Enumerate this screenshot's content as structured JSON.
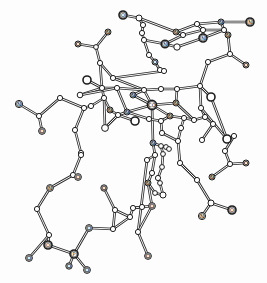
{
  "diagram": {
    "title": "",
    "type": "ball-and-stick molecular structure",
    "colors": {
      "line": "#2a2a2a",
      "atom_fill": "#ffffff",
      "background": "#fdfdfd"
    },
    "atoms": [
      {
        "id": "a1",
        "x": 123,
        "y": 15,
        "r": 4,
        "label": "O"
      },
      {
        "id": "a2",
        "x": 139,
        "y": 18,
        "r": 3,
        "label": ""
      },
      {
        "id": "a3",
        "x": 143,
        "y": 25,
        "r": 2.6,
        "label": ""
      },
      {
        "id": "a4",
        "x": 142,
        "y": 33,
        "r": 2.6,
        "label": ""
      },
      {
        "id": "a5",
        "x": 144,
        "y": 40,
        "r": 2.6,
        "label": ""
      },
      {
        "id": "a6",
        "x": 149,
        "y": 55,
        "r": 2.6,
        "label": ""
      },
      {
        "id": "a7",
        "x": 155,
        "y": 62,
        "r": 3,
        "label": "O"
      },
      {
        "id": "a8",
        "x": 160,
        "y": 70,
        "r": 2.6,
        "label": ""
      },
      {
        "id": "a9",
        "x": 164,
        "y": 71,
        "r": 2.6,
        "label": ""
      },
      {
        "id": "b1",
        "x": 197,
        "y": 24,
        "r": 2.6,
        "label": ""
      },
      {
        "id": "b2",
        "x": 221,
        "y": 22,
        "r": 3,
        "label": "N"
      },
      {
        "id": "b3",
        "x": 250,
        "y": 22,
        "r": 4,
        "label": "N"
      },
      {
        "id": "b4",
        "x": 176,
        "y": 32,
        "r": 3,
        "label": "N"
      },
      {
        "id": "b5",
        "x": 183,
        "y": 35,
        "r": 2.6,
        "label": ""
      },
      {
        "id": "b6",
        "x": 203,
        "y": 30,
        "r": 2.6,
        "label": ""
      },
      {
        "id": "b7",
        "x": 224,
        "y": 30,
        "r": 2.6,
        "label": ""
      },
      {
        "id": "b8",
        "x": 228,
        "y": 35,
        "r": 3,
        "label": "N"
      },
      {
        "id": "b9",
        "x": 203,
        "y": 38,
        "r": 4,
        "label": "N"
      },
      {
        "id": "b10",
        "x": 165,
        "y": 44,
        "r": 3.8,
        "label": "N"
      },
      {
        "id": "b11",
        "x": 177,
        "y": 47,
        "r": 3.2,
        "label": ""
      },
      {
        "id": "b12",
        "x": 230,
        "y": 54,
        "r": 2.6,
        "label": ""
      },
      {
        "id": "b13",
        "x": 208,
        "y": 62,
        "r": 2.6,
        "label": ""
      },
      {
        "id": "b14",
        "x": 246,
        "y": 65,
        "r": 3,
        "label": "O"
      },
      {
        "id": "c1",
        "x": 108,
        "y": 32,
        "r": 3,
        "label": "N"
      },
      {
        "id": "c2",
        "x": 78,
        "y": 44,
        "r": 3,
        "label": "O"
      },
      {
        "id": "c3",
        "x": 96,
        "y": 47,
        "r": 2.4,
        "label": ""
      },
      {
        "id": "c4",
        "x": 100,
        "y": 63,
        "r": 2.6,
        "label": ""
      },
      {
        "id": "c5",
        "x": 113,
        "y": 78,
        "r": 2.6,
        "label": ""
      },
      {
        "id": "c6",
        "x": 87,
        "y": 80,
        "r": 4,
        "label": ""
      },
      {
        "id": "c7",
        "x": 80,
        "y": 95,
        "r": 2.8,
        "label": ""
      },
      {
        "id": "c8",
        "x": 102,
        "y": 88,
        "r": 2.6,
        "label": ""
      },
      {
        "id": "c9",
        "x": 117,
        "y": 88,
        "r": 2.6,
        "label": ""
      },
      {
        "id": "c10",
        "x": 104,
        "y": 98,
        "r": 2.6,
        "label": ""
      },
      {
        "id": "c11",
        "x": 91,
        "y": 106,
        "r": 2.6,
        "label": ""
      },
      {
        "id": "c12",
        "x": 84,
        "y": 108,
        "r": 2.6,
        "label": ""
      },
      {
        "id": "c13",
        "x": 110,
        "y": 110,
        "r": 3,
        "label": "N"
      },
      {
        "id": "c14",
        "x": 127,
        "y": 112,
        "r": 3,
        "label": "N"
      },
      {
        "id": "c15",
        "x": 118,
        "y": 115,
        "r": 2.6,
        "label": ""
      },
      {
        "id": "c16",
        "x": 105,
        "y": 128,
        "r": 3.4,
        "label": ""
      },
      {
        "id": "c17",
        "x": 135,
        "y": 121,
        "r": 4,
        "label": ""
      },
      {
        "id": "c18",
        "x": 75,
        "y": 130,
        "r": 2.6,
        "label": ""
      },
      {
        "id": "c19",
        "x": 60,
        "y": 98,
        "r": 2.6,
        "label": ""
      },
      {
        "id": "c20",
        "x": 39,
        "y": 116,
        "r": 2.6,
        "label": ""
      },
      {
        "id": "c21",
        "x": 19,
        "y": 104,
        "r": 3.6,
        "label": "N"
      },
      {
        "id": "c22",
        "x": 42,
        "y": 131,
        "r": 3.4,
        "label": "O"
      },
      {
        "id": "c23",
        "x": 81,
        "y": 153,
        "r": 2.6,
        "label": ""
      },
      {
        "id": "co",
        "x": 152,
        "y": 105,
        "r": 4.6,
        "label": "CO"
      },
      {
        "id": "d1",
        "x": 144,
        "y": 90,
        "r": 2.6,
        "label": ""
      },
      {
        "id": "d2",
        "x": 177,
        "y": 89,
        "r": 2.6,
        "label": ""
      },
      {
        "id": "d3",
        "x": 161,
        "y": 89,
        "r": 2.6,
        "label": ""
      },
      {
        "id": "d4",
        "x": 133,
        "y": 95,
        "r": 3,
        "label": "N"
      },
      {
        "id": "d5",
        "x": 176,
        "y": 103,
        "r": 3,
        "label": "N"
      },
      {
        "id": "d6",
        "x": 170,
        "y": 116,
        "r": 3,
        "label": "N"
      },
      {
        "id": "d7",
        "x": 161,
        "y": 121,
        "r": 2.6,
        "label": ""
      },
      {
        "id": "d8",
        "x": 149,
        "y": 119,
        "r": 2.6,
        "label": ""
      },
      {
        "id": "d9",
        "x": 200,
        "y": 86,
        "r": 2.6,
        "label": ""
      },
      {
        "id": "d10",
        "x": 211,
        "y": 97,
        "r": 4,
        "label": ""
      },
      {
        "id": "d11",
        "x": 201,
        "y": 108,
        "r": 2.6,
        "label": ""
      },
      {
        "id": "d12",
        "x": 205,
        "y": 117,
        "r": 2.6,
        "label": ""
      },
      {
        "id": "d13",
        "x": 194,
        "y": 120,
        "r": 2.6,
        "label": ""
      },
      {
        "id": "d14",
        "x": 184,
        "y": 118,
        "r": 2.6,
        "label": ""
      },
      {
        "id": "d15",
        "x": 181,
        "y": 128,
        "r": 2.6,
        "label": ""
      },
      {
        "id": "d16",
        "x": 162,
        "y": 133,
        "r": 2.6,
        "label": ""
      },
      {
        "id": "d17",
        "x": 178,
        "y": 141,
        "r": 2.6,
        "label": ""
      },
      {
        "id": "d18",
        "x": 202,
        "y": 140,
        "r": 2.6,
        "label": ""
      },
      {
        "id": "d19",
        "x": 213,
        "y": 124,
        "r": 2.6,
        "label": ""
      },
      {
        "id": "e1",
        "x": 234,
        "y": 136,
        "r": 2.6,
        "label": ""
      },
      {
        "id": "e2",
        "x": 227,
        "y": 139,
        "r": 4,
        "label": ""
      },
      {
        "id": "e3",
        "x": 225,
        "y": 151,
        "r": 2.6,
        "label": ""
      },
      {
        "id": "e4",
        "x": 230,
        "y": 164,
        "r": 2.6,
        "label": ""
      },
      {
        "id": "e5",
        "x": 246,
        "y": 163,
        "r": 3,
        "label": "O"
      },
      {
        "id": "e6",
        "x": 212,
        "y": 177,
        "r": 3,
        "label": "N"
      },
      {
        "id": "f1",
        "x": 153,
        "y": 143,
        "r": 3,
        "label": "N"
      },
      {
        "id": "f2",
        "x": 161,
        "y": 146,
        "r": 2.4,
        "label": ""
      },
      {
        "id": "f3",
        "x": 166,
        "y": 147,
        "r": 2.4,
        "label": ""
      },
      {
        "id": "f4",
        "x": 169,
        "y": 149,
        "r": 2.4,
        "label": ""
      },
      {
        "id": "f5",
        "x": 155,
        "y": 155,
        "r": 2.6,
        "label": ""
      },
      {
        "id": "f6",
        "x": 163,
        "y": 154,
        "r": 2.4,
        "label": ""
      },
      {
        "id": "f7",
        "x": 147,
        "y": 160,
        "r": 2.6,
        "label": ""
      },
      {
        "id": "f8",
        "x": 162,
        "y": 167,
        "r": 2.4,
        "label": ""
      },
      {
        "id": "f9",
        "x": 152,
        "y": 173,
        "r": 2.6,
        "label": ""
      },
      {
        "id": "f10",
        "x": 158,
        "y": 178,
        "r": 2.6,
        "label": ""
      },
      {
        "id": "f11",
        "x": 148,
        "y": 183,
        "r": 3,
        "label": "N"
      },
      {
        "id": "f12",
        "x": 160,
        "y": 183,
        "r": 2.4,
        "label": ""
      },
      {
        "id": "f13",
        "x": 155,
        "y": 193,
        "r": 2.4,
        "label": ""
      },
      {
        "id": "f14",
        "x": 163,
        "y": 195,
        "r": 3,
        "label": ""
      },
      {
        "id": "g1",
        "x": 180,
        "y": 163,
        "r": 2.6,
        "label": ""
      },
      {
        "id": "g2",
        "x": 197,
        "y": 180,
        "r": 2.6,
        "label": ""
      },
      {
        "id": "g3",
        "x": 211,
        "y": 203,
        "r": 3,
        "label": ""
      },
      {
        "id": "g4",
        "x": 232,
        "y": 210,
        "r": 4,
        "label": "O"
      },
      {
        "id": "g5",
        "x": 202,
        "y": 216,
        "r": 3.6,
        "label": "N"
      },
      {
        "id": "h1",
        "x": 142,
        "y": 207,
        "r": 2.6,
        "label": ""
      },
      {
        "id": "h2",
        "x": 152,
        "y": 206,
        "r": 3.4,
        "label": "O"
      },
      {
        "id": "h3",
        "x": 138,
        "y": 232,
        "r": 2.6,
        "label": ""
      },
      {
        "id": "h4",
        "x": 148,
        "y": 256,
        "r": 3.4,
        "label": "O"
      },
      {
        "id": "i1",
        "x": 81,
        "y": 155,
        "r": 2.6,
        "label": ""
      },
      {
        "id": "i2",
        "x": 73,
        "y": 175,
        "r": 2.6,
        "label": ""
      },
      {
        "id": "i3",
        "x": 78,
        "y": 177,
        "r": 3.4,
        "label": "O"
      },
      {
        "id": "i4",
        "x": 50,
        "y": 188,
        "r": 3.4,
        "label": "N"
      },
      {
        "id": "i5",
        "x": 37,
        "y": 209,
        "r": 2.6,
        "label": ""
      },
      {
        "id": "i6",
        "x": 49,
        "y": 235,
        "r": 2.6,
        "label": ""
      },
      {
        "id": "i7",
        "x": 48,
        "y": 245,
        "r": 4,
        "label": "O"
      },
      {
        "id": "i8",
        "x": 29,
        "y": 258,
        "r": 3.4,
        "label": "O"
      },
      {
        "id": "i9",
        "x": 74,
        "y": 254,
        "r": 4,
        "label": "P"
      },
      {
        "id": "i10",
        "x": 69,
        "y": 266,
        "r": 3.2,
        "label": "O"
      },
      {
        "id": "i11",
        "x": 87,
        "y": 270,
        "r": 3.4,
        "label": "O"
      },
      {
        "id": "i12",
        "x": 89,
        "y": 228,
        "r": 3.4,
        "label": "O"
      },
      {
        "id": "j1",
        "x": 104,
        "y": 188,
        "r": 3.2,
        "label": "O"
      },
      {
        "id": "j2",
        "x": 115,
        "y": 210,
        "r": 2.6,
        "label": ""
      },
      {
        "id": "j3",
        "x": 113,
        "y": 229,
        "r": 2.6,
        "label": ""
      },
      {
        "id": "j4",
        "x": 130,
        "y": 217,
        "r": 2.6,
        "label": ""
      },
      {
        "id": "j5",
        "x": 133,
        "y": 208,
        "r": 2.6,
        "label": ""
      }
    ],
    "bonds": [
      [
        "a1",
        "a2"
      ],
      [
        "a2",
        "a3"
      ],
      [
        "a3",
        "a4"
      ],
      [
        "a4",
        "a5"
      ],
      [
        "a5",
        "a6"
      ],
      [
        "a6",
        "a7"
      ],
      [
        "a7",
        "a8"
      ],
      [
        "a8",
        "a9"
      ],
      [
        "a5",
        "b10"
      ],
      [
        "a2",
        "b4"
      ],
      [
        "b4",
        "b1"
      ],
      [
        "b1",
        "b2"
      ],
      [
        "b2",
        "b3"
      ],
      [
        "b4",
        "b5"
      ],
      [
        "b5",
        "b6"
      ],
      [
        "b6",
        "b7"
      ],
      [
        "b7",
        "b8"
      ],
      [
        "b2",
        "b7"
      ],
      [
        "b10",
        "b11"
      ],
      [
        "b11",
        "b9"
      ],
      [
        "b9",
        "b7"
      ],
      [
        "b10",
        "b5"
      ],
      [
        "b6",
        "b9"
      ],
      [
        "b1",
        "b6"
      ],
      [
        "b8",
        "b12"
      ],
      [
        "b12",
        "b13"
      ],
      [
        "b12",
        "b14"
      ],
      [
        "b13",
        "d9"
      ],
      [
        "c1",
        "c3"
      ],
      [
        "c2",
        "c3"
      ],
      [
        "c3",
        "c4"
      ],
      [
        "c4",
        "c5"
      ],
      [
        "c4",
        "c8"
      ],
      [
        "c5",
        "a9"
      ],
      [
        "c5",
        "d1"
      ],
      [
        "c6",
        "c8"
      ],
      [
        "c7",
        "c8"
      ],
      [
        "c8",
        "c9"
      ],
      [
        "c8",
        "c10"
      ],
      [
        "c9",
        "d1"
      ],
      [
        "c9",
        "c14"
      ],
      [
        "c10",
        "c11"
      ],
      [
        "c10",
        "c13"
      ],
      [
        "c11",
        "c12"
      ],
      [
        "c12",
        "c19"
      ],
      [
        "c19",
        "c20"
      ],
      [
        "c20",
        "c21"
      ],
      [
        "c20",
        "c22"
      ],
      [
        "c12",
        "c18"
      ],
      [
        "c18",
        "c23"
      ],
      [
        "c13",
        "c15"
      ],
      [
        "c15",
        "c14"
      ],
      [
        "c15",
        "c16"
      ],
      [
        "c14",
        "co"
      ],
      [
        "c15",
        "c17"
      ],
      [
        "c9",
        "c7"
      ],
      [
        "c10",
        "c16"
      ],
      [
        "co",
        "d4"
      ],
      [
        "co",
        "d5"
      ],
      [
        "co",
        "d6"
      ],
      [
        "co",
        "d1"
      ],
      [
        "co",
        "f1"
      ],
      [
        "d4",
        "d1"
      ],
      [
        "d1",
        "d3"
      ],
      [
        "d3",
        "d2"
      ],
      [
        "d2",
        "d5"
      ],
      [
        "d2",
        "d9"
      ],
      [
        "d9",
        "d10"
      ],
      [
        "d9",
        "d11"
      ],
      [
        "d11",
        "d12"
      ],
      [
        "d12",
        "d13"
      ],
      [
        "d13",
        "d5"
      ],
      [
        "d6",
        "d14"
      ],
      [
        "d14",
        "d13"
      ],
      [
        "d6",
        "d7"
      ],
      [
        "d7",
        "d8"
      ],
      [
        "d8",
        "c14"
      ],
      [
        "d14",
        "d15"
      ],
      [
        "d15",
        "d17"
      ],
      [
        "d7",
        "d16"
      ],
      [
        "d16",
        "d17"
      ],
      [
        "d12",
        "d19"
      ],
      [
        "d19",
        "d18"
      ],
      [
        "d11",
        "e2"
      ],
      [
        "d10",
        "e2"
      ],
      [
        "e2",
        "e1"
      ],
      [
        "e1",
        "e3"
      ],
      [
        "e3",
        "e4"
      ],
      [
        "e4",
        "e5"
      ],
      [
        "e4",
        "e6"
      ],
      [
        "f1",
        "f2"
      ],
      [
        "f2",
        "f3"
      ],
      [
        "f3",
        "f4"
      ],
      [
        "f1",
        "f5"
      ],
      [
        "f2",
        "f6"
      ],
      [
        "f5",
        "f7"
      ],
      [
        "f6",
        "f8"
      ],
      [
        "f5",
        "f9"
      ],
      [
        "f8",
        "f10"
      ],
      [
        "f9",
        "f11"
      ],
      [
        "f10",
        "f12"
      ],
      [
        "f11",
        "f13"
      ],
      [
        "f12",
        "f14"
      ],
      [
        "f11",
        "h2"
      ],
      [
        "f13",
        "f14"
      ],
      [
        "d17",
        "g1"
      ],
      [
        "g1",
        "g2"
      ],
      [
        "g2",
        "g3"
      ],
      [
        "g3",
        "g4"
      ],
      [
        "g3",
        "g5"
      ],
      [
        "h2",
        "h1"
      ],
      [
        "h1",
        "j5"
      ],
      [
        "f7",
        "h3"
      ],
      [
        "h3",
        "h4"
      ],
      [
        "h2",
        "h3"
      ],
      [
        "c23",
        "i1"
      ],
      [
        "i1",
        "i2"
      ],
      [
        "i2",
        "i3"
      ],
      [
        "i2",
        "i4"
      ],
      [
        "i4",
        "i5"
      ],
      [
        "i5",
        "i6"
      ],
      [
        "i6",
        "i7"
      ],
      [
        "i6",
        "i8"
      ],
      [
        "i7",
        "i9"
      ],
      [
        "i9",
        "i10"
      ],
      [
        "i9",
        "i11"
      ],
      [
        "i9",
        "i12"
      ],
      [
        "i12",
        "j3"
      ],
      [
        "j1",
        "j2"
      ],
      [
        "j2",
        "j3"
      ],
      [
        "j2",
        "j4"
      ],
      [
        "j3",
        "j4"
      ],
      [
        "j4",
        "j5"
      ],
      [
        "j5",
        "h1"
      ]
    ]
  }
}
